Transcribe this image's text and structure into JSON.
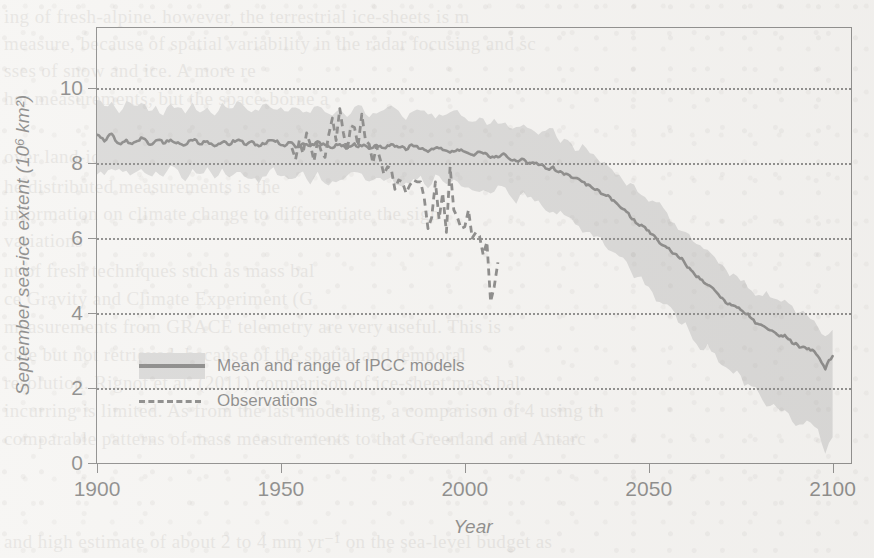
{
  "figure": {
    "y_axis_title": "September sea-ice extent (10⁶ km²)",
    "x_axis_title": "Year"
  },
  "legend": {
    "items": [
      {
        "label": "Mean and range of IPCC models",
        "style": "band-with-line"
      },
      {
        "label": "Observations",
        "style": "dashed-line"
      }
    ]
  },
  "ghost_text": [
    {
      "text": "ing of fresh-alpine. however, the terrestrial ice-sheets is m",
      "x": 4,
      "y": 6
    },
    {
      "text": "measure, because of spatial variability in the radar focusing and sc",
      "x": 4,
      "y": 33
    },
    {
      "text": "sses of snow and ice. A more re",
      "x": 4,
      "y": 60
    },
    {
      "text": "her measurements, but the space-borne a",
      "x": 4,
      "y": 88
    },
    {
      "text": "over land-ice sheets, but also a componen",
      "x": 4,
      "y": 146
    },
    {
      "text": "he distributed measurements is the",
      "x": 4,
      "y": 176
    },
    {
      "text": "information on climate change to differentiate the sign",
      "x": 4,
      "y": 203
    },
    {
      "text": "variations",
      "x": 4,
      "y": 230
    },
    {
      "text": "nt of fresh techniques such as mass bal",
      "x": 4,
      "y": 260
    },
    {
      "text": "ce Gravity and Climate Experiment (G",
      "x": 4,
      "y": 288
    },
    {
      "text": "measurements from GRACE telemetry are very useful. This is",
      "x": 4,
      "y": 316
    },
    {
      "text": "clue but not retrieved, because of the spatial and temporal",
      "x": 4,
      "y": 344
    },
    {
      "text": "resolution. Rignot et al. (2011) comparison of ice-sheet mass bal",
      "x": 4,
      "y": 372
    },
    {
      "text": "incurring is limited. As from the last modelling, a comparison of 4 using th",
      "x": 4,
      "y": 400
    },
    {
      "text": "comparable patterns of mass measurements to that Greenland and Antarc",
      "x": 4,
      "y": 428
    },
    {
      "text": "and high estimate of about 2 to 4 mm yr⁻¹ on the sea-level budget as",
      "x": 4,
      "y": 530
    }
  ],
  "chart_data": {
    "type": "line",
    "title": "",
    "xlabel": "Year",
    "ylabel": "September sea-ice extent (10⁶ km²)",
    "xlim": [
      1900,
      2105
    ],
    "ylim": [
      0,
      11.6
    ],
    "xticks": [
      1900,
      1950,
      2000,
      2050,
      2100
    ],
    "yticks": [
      0,
      2,
      4,
      6,
      8,
      10
    ],
    "grid": "horizontal-dotted",
    "legend_position": "inside-lower-left",
    "colors": {
      "band": "#b9b9b9",
      "mean_line": "#151515",
      "observations": "#151515",
      "axis": "#1d1d1d"
    },
    "series": [
      {
        "name": "Mean and range of IPCC models",
        "type": "line-with-band",
        "x": [
          1900,
          1902,
          1904,
          1906,
          1908,
          1910,
          1912,
          1914,
          1916,
          1918,
          1920,
          1922,
          1924,
          1926,
          1928,
          1930,
          1932,
          1934,
          1936,
          1938,
          1940,
          1942,
          1944,
          1946,
          1948,
          1950,
          1952,
          1954,
          1956,
          1958,
          1960,
          1962,
          1964,
          1966,
          1968,
          1970,
          1972,
          1974,
          1976,
          1978,
          1980,
          1982,
          1984,
          1986,
          1988,
          1990,
          1992,
          1994,
          1996,
          1998,
          2000,
          2002,
          2004,
          2006,
          2008,
          2010,
          2012,
          2014,
          2016,
          2018,
          2020,
          2022,
          2024,
          2026,
          2028,
          2030,
          2032,
          2034,
          2036,
          2038,
          2040,
          2042,
          2044,
          2046,
          2048,
          2050,
          2052,
          2054,
          2056,
          2058,
          2060,
          2062,
          2064,
          2066,
          2068,
          2070,
          2072,
          2074,
          2076,
          2078,
          2080,
          2082,
          2084,
          2086,
          2088,
          2090,
          2092,
          2094,
          2096,
          2098,
          2100
        ],
        "mean": [
          8.75,
          8.58,
          8.78,
          8.52,
          8.62,
          8.55,
          8.68,
          8.5,
          8.6,
          8.52,
          8.62,
          8.55,
          8.48,
          8.6,
          8.5,
          8.58,
          8.45,
          8.55,
          8.48,
          8.6,
          8.5,
          8.58,
          8.45,
          8.52,
          8.6,
          8.48,
          8.55,
          8.42,
          8.52,
          8.45,
          8.58,
          8.48,
          8.4,
          8.5,
          8.42,
          8.52,
          8.45,
          8.38,
          8.48,
          8.4,
          8.5,
          8.42,
          8.35,
          8.45,
          8.38,
          8.3,
          8.4,
          8.35,
          8.28,
          8.36,
          8.3,
          8.22,
          8.3,
          8.24,
          8.15,
          8.22,
          8.12,
          8.05,
          8.1,
          8.0,
          7.95,
          7.85,
          7.9,
          7.78,
          7.7,
          7.6,
          7.5,
          7.4,
          7.3,
          7.15,
          7.0,
          6.85,
          6.7,
          6.5,
          6.35,
          6.2,
          6.0,
          5.8,
          5.65,
          5.5,
          5.3,
          5.1,
          4.9,
          4.75,
          4.6,
          4.4,
          4.25,
          4.15,
          4.0,
          3.85,
          3.7,
          3.6,
          3.5,
          3.4,
          3.3,
          3.2,
          3.1,
          3.0,
          2.85,
          2.5,
          2.85
        ],
        "band_upper": [
          9.6,
          9.5,
          9.65,
          9.4,
          9.55,
          9.45,
          9.6,
          9.38,
          9.52,
          9.42,
          9.55,
          9.45,
          9.35,
          9.5,
          9.4,
          9.5,
          9.35,
          9.45,
          9.38,
          9.52,
          9.4,
          9.5,
          9.35,
          9.45,
          9.52,
          9.4,
          9.48,
          9.35,
          9.45,
          9.38,
          9.5,
          9.4,
          9.3,
          9.42,
          9.35,
          9.45,
          9.38,
          9.3,
          9.4,
          9.32,
          9.42,
          9.35,
          9.28,
          9.38,
          9.3,
          9.22,
          9.32,
          9.28,
          9.2,
          9.28,
          9.22,
          9.15,
          9.22,
          9.15,
          9.05,
          9.12,
          9.0,
          8.92,
          9.0,
          8.9,
          8.82,
          8.72,
          8.78,
          8.65,
          8.55,
          8.45,
          8.35,
          8.25,
          8.15,
          8.0,
          7.85,
          7.7,
          7.55,
          7.35,
          7.2,
          7.05,
          6.85,
          6.65,
          6.5,
          6.35,
          6.15,
          5.95,
          5.75,
          5.6,
          5.45,
          5.25,
          5.1,
          5.0,
          4.85,
          4.7,
          4.55,
          4.45,
          4.35,
          4.25,
          4.15,
          4.05,
          3.95,
          3.85,
          3.7,
          3.35,
          3.7
        ],
        "band_lower": [
          7.85,
          7.72,
          7.9,
          7.68,
          7.78,
          7.7,
          7.82,
          7.65,
          7.75,
          7.68,
          7.78,
          7.7,
          7.62,
          7.75,
          7.65,
          7.72,
          7.6,
          7.7,
          7.62,
          7.75,
          7.65,
          7.72,
          7.6,
          7.68,
          7.75,
          7.62,
          7.7,
          7.58,
          7.68,
          7.6,
          7.72,
          7.62,
          7.55,
          7.65,
          7.58,
          7.68,
          7.6,
          7.52,
          7.62,
          7.55,
          7.65,
          7.55,
          7.48,
          7.58,
          7.5,
          7.42,
          7.52,
          7.46,
          7.38,
          7.46,
          7.38,
          7.3,
          7.36,
          7.28,
          7.18,
          7.24,
          7.12,
          7.02,
          7.08,
          6.96,
          6.86,
          6.74,
          6.78,
          6.62,
          6.5,
          6.36,
          6.22,
          6.08,
          5.94,
          5.76,
          5.58,
          5.4,
          5.22,
          5.0,
          4.82,
          4.64,
          4.42,
          4.2,
          4.02,
          3.84,
          3.62,
          3.4,
          3.18,
          3.0,
          2.82,
          2.6,
          2.42,
          2.3,
          2.12,
          1.94,
          1.76,
          1.64,
          1.52,
          1.4,
          1.28,
          1.16,
          1.04,
          0.92,
          0.75,
          0.42,
          0.75
        ]
      },
      {
        "name": "Observations",
        "type": "dashed-line",
        "x": [
          1953,
          1954,
          1955,
          1956,
          1957,
          1958,
          1959,
          1960,
          1961,
          1962,
          1963,
          1964,
          1965,
          1966,
          1967,
          1968,
          1969,
          1970,
          1971,
          1972,
          1973,
          1974,
          1975,
          1976,
          1977,
          1978,
          1979,
          1980,
          1981,
          1982,
          1983,
          1984,
          1985,
          1986,
          1987,
          1988,
          1989,
          1990,
          1991,
          1992,
          1993,
          1994,
          1995,
          1996,
          1997,
          1998,
          1999,
          2000,
          2001,
          2002,
          2003,
          2004,
          2005,
          2006,
          2007,
          2008,
          2009
        ],
        "y": [
          8.4,
          8.1,
          8.6,
          8.25,
          8.8,
          8.5,
          8.05,
          8.6,
          8.3,
          8.15,
          8.75,
          9.2,
          8.6,
          9.45,
          8.8,
          8.3,
          9.0,
          8.95,
          8.45,
          9.3,
          8.6,
          8.5,
          8.0,
          8.45,
          8.1,
          7.7,
          7.9,
          7.85,
          7.3,
          7.55,
          7.5,
          7.2,
          7.4,
          7.55,
          7.5,
          7.5,
          7.05,
          6.25,
          6.55,
          7.5,
          6.5,
          7.2,
          6.15,
          7.9,
          6.75,
          6.55,
          6.25,
          6.3,
          6.75,
          6.0,
          6.15,
          6.05,
          5.55,
          5.9,
          4.3,
          4.7,
          5.35
        ]
      }
    ]
  }
}
